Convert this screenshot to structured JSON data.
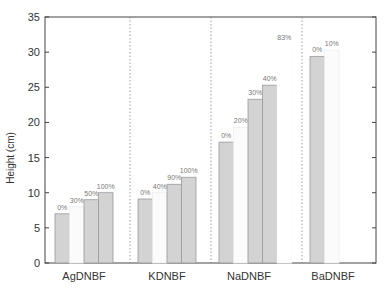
{
  "chart_data": {
    "type": "bar",
    "title": "",
    "xlabel": "",
    "ylabel": "Height (cm)",
    "ylim": [
      0,
      35
    ],
    "yticks": [
      0,
      5,
      10,
      15,
      20,
      25,
      30,
      35
    ],
    "grid": false,
    "legend": null,
    "group_separators": "dotted vertical lines",
    "categories": [
      "AgDNBF",
      "KDNBF",
      "NaDNBF",
      "BaDNBF"
    ],
    "groups": [
      {
        "name": "AgDNBF",
        "bars": [
          {
            "label": "0%",
            "value": 7.0,
            "shade": "dark"
          },
          {
            "label": "30%",
            "value": 8.0,
            "shade": "faint"
          },
          {
            "label": "50%",
            "value": 9.0,
            "shade": "dark"
          },
          {
            "label": "100%",
            "value": 10.0,
            "shade": "dark"
          }
        ]
      },
      {
        "name": "KDNBF",
        "bars": [
          {
            "label": "0%",
            "value": 9.1,
            "shade": "dark"
          },
          {
            "label": "40%",
            "value": 10.0,
            "shade": "faint"
          },
          {
            "label": "90%",
            "value": 11.2,
            "shade": "dark"
          },
          {
            "label": "100%",
            "value": 12.2,
            "shade": "dark"
          }
        ]
      },
      {
        "name": "NaDNBF",
        "bars": [
          {
            "label": "0%",
            "value": 17.2,
            "shade": "dark"
          },
          {
            "label": "20%",
            "value": 19.3,
            "shade": "faint"
          },
          {
            "label": "30%",
            "value": 23.3,
            "shade": "dark"
          },
          {
            "label": "40%",
            "value": 25.3,
            "shade": "dark"
          },
          {
            "label": "83%",
            "value": 31.2,
            "shade": "invisible"
          }
        ]
      },
      {
        "name": "BaDNBF",
        "bars": [
          {
            "label": "0%",
            "value": 29.4,
            "shade": "dark"
          },
          {
            "label": "10%",
            "value": 30.3,
            "shade": "faint"
          }
        ]
      }
    ]
  },
  "colors": {
    "dark_bar": "#d3d3d3",
    "dark_bar_edge": "#9a9a9a",
    "faint_bar": "#fbfbfb",
    "faint_bar_edge": "#eeeeee",
    "axis": "#444444",
    "separator": "#888888",
    "bar_label": "#777777"
  }
}
